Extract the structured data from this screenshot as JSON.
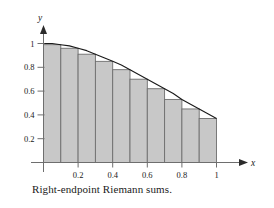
{
  "caption": "Right-endpoint Riemann sums.",
  "axis": {
    "x_name": "x",
    "y_name": "y"
  },
  "colors": {
    "bar_fill": "#c8c8c8",
    "bar_stroke": "#6e6e6e",
    "curve": "#1a1a1a",
    "axis": "#6e6e6e",
    "text": "#1a1a1a",
    "background": "#ffffff"
  },
  "chart_data": {
    "type": "bar",
    "title": "Right-endpoint Riemann sums.",
    "xlabel": "x",
    "ylabel": "y",
    "xlim": [
      0,
      1.12
    ],
    "ylim": [
      0,
      1.1
    ],
    "grid": false,
    "legend": null,
    "x_ticks": [
      0.2,
      0.4,
      0.6,
      0.8,
      1
    ],
    "x_tick_labels": [
      "0.2",
      "0.4",
      "0.6",
      "0.8",
      "1"
    ],
    "y_ticks": [
      0.2,
      0.4,
      0.6,
      0.8,
      1
    ],
    "y_tick_labels": [
      "0.2",
      "0.4",
      "0.6",
      "0.8",
      "1"
    ],
    "n_rectangles": 10,
    "rule": "right-endpoint",
    "bar_width": 0.1,
    "bar_left_edges": [
      0.0,
      0.1,
      0.2,
      0.3,
      0.4,
      0.5,
      0.6,
      0.7,
      0.8,
      0.9
    ],
    "bar_right_edges": [
      0.1,
      0.2,
      0.3,
      0.4,
      0.5,
      0.6,
      0.7,
      0.8,
      0.9,
      1.0
    ],
    "categories": [
      "0.0-0.1",
      "0.1-0.2",
      "0.2-0.3",
      "0.3-0.4",
      "0.4-0.5",
      "0.5-0.6",
      "0.6-0.7",
      "0.7-0.8",
      "0.8-0.9",
      "0.9-1.0"
    ],
    "values": [
      0.99,
      0.96,
      0.91,
      0.85,
      0.78,
      0.7,
      0.62,
      0.53,
      0.45,
      0.37
    ],
    "series": [
      {
        "name": "right-endpoint rectangles",
        "values": [
          0.99,
          0.96,
          0.91,
          0.85,
          0.78,
          0.7,
          0.62,
          0.53,
          0.45,
          0.37
        ]
      }
    ],
    "curve": {
      "name": "f(x)",
      "x": [
        0.0,
        0.05,
        0.1,
        0.15,
        0.2,
        0.25,
        0.3,
        0.35,
        0.4,
        0.45,
        0.5,
        0.55,
        0.6,
        0.65,
        0.7,
        0.75,
        0.8,
        0.85,
        0.9,
        0.95,
        1.0
      ],
      "y": [
        1.0,
        1.0,
        0.99,
        0.98,
        0.96,
        0.94,
        0.91,
        0.88,
        0.85,
        0.82,
        0.78,
        0.74,
        0.7,
        0.66,
        0.62,
        0.58,
        0.53,
        0.49,
        0.45,
        0.41,
        0.37
      ]
    }
  }
}
